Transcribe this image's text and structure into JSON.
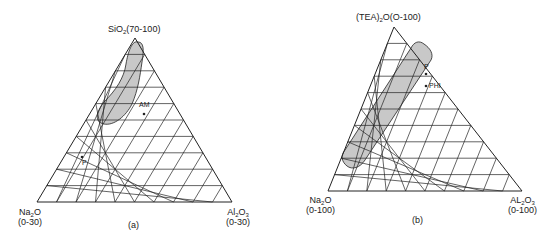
{
  "figure": {
    "panels": [
      {
        "id": "a",
        "caption": "(a)",
        "apex_label": {
          "main": "SiO",
          "sub": "2",
          "rest": "(70-100)"
        },
        "left_label": {
          "main": "Na",
          "sub": "2",
          "rest": "O",
          "range": "(0-30)"
        },
        "right_label": {
          "main": "Al",
          "sub": "2",
          "rest": "O",
          "sub2": "3",
          "range": "(0-30)"
        },
        "geometry": {
          "apex": [
            135,
            38
          ],
          "left": [
            37,
            202
          ],
          "right": [
            232,
            202
          ],
          "divisions": 10
        },
        "points": [
          {
            "label": "AM",
            "x": 144,
            "y": 114,
            "lx": 139,
            "ly": 101
          },
          {
            "label": "P",
            "x": 82,
            "y": 157,
            "lx": 82,
            "ly": 160
          }
        ],
        "region": {
          "type": "ellipse-curve",
          "path": "M138,42 C132,40 128,52 126,64 C124,78 116,90 104,102 C96,112 94,122 104,124 C114,126 126,116 132,104 C138,90 140,76 142,62 C144,50 144,42 138,42 Z"
        }
      },
      {
        "id": "b",
        "caption": "(b)",
        "apex_label": {
          "main": "(TEA)",
          "sub": "2",
          "rest": "O(O-100)"
        },
        "left_label": {
          "main": "Na",
          "sub": "2",
          "rest": "O",
          "range": "(0-100)"
        },
        "right_label": {
          "main": "AL",
          "sub": "2",
          "rest": "O",
          "sub2": "3",
          "range": "(0-100)"
        },
        "geometry": {
          "apex": [
            394,
            27
          ],
          "left": [
            328,
            191
          ],
          "right": [
            522,
            191
          ],
          "divisions": 10
        },
        "points": [
          {
            "label": "P",
            "x": 426,
            "y": 74,
            "lx": 424,
            "ly": 63
          },
          {
            "label": "PHI",
            "x": 426,
            "y": 86,
            "lx": 429,
            "ly": 82
          }
        ],
        "region": {
          "type": "capsule",
          "path": "M424,44 C430,48 434,54 431,60 L365,160 C360,168 352,170 347,166 C342,162 340,156 345,150 L411,48 C414,42 419,40 424,44 Z"
        }
      }
    ],
    "style": {
      "line_color": "#222222",
      "region_fill": "#c8c8c8",
      "background": "#ffffff"
    }
  }
}
